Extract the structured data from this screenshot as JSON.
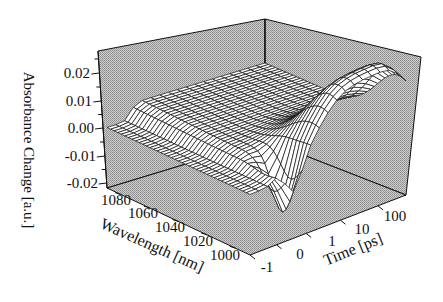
{
  "chart_data": {
    "type": "surface3d",
    "title": "",
    "zlabel": "Absorbance Change [a.u.]",
    "xlabel": "Wavelength [nm]",
    "ylabel": "Time [ps]",
    "z_ticks": [
      "0.02",
      "0.01",
      "0.00",
      "-0.01",
      "-0.02"
    ],
    "z_range": [
      -0.025,
      0.025
    ],
    "wavelength_ticks": [
      "1080",
      "1060",
      "1040",
      "1020",
      "1000"
    ],
    "wavelength_range": [
      1090,
      990
    ],
    "time_ticks": [
      "-1",
      "0",
      "1",
      "10",
      "100"
    ],
    "time_scale": "linear-log",
    "wavelength": [
      1090,
      1080,
      1070,
      1060,
      1050,
      1040,
      1030,
      1020,
      1010,
      1000,
      990
    ],
    "time": [
      -1,
      -0.5,
      0,
      0.5,
      1,
      3,
      10,
      30,
      100,
      300
    ],
    "z_description": "Near-zero before t=0; step rise to ~+0.005 around t=0 at long wavelengths; negative bleach dip reaching ~-0.02 near 1000 nm around 0-1 ps; broad positive band peaking ~+0.02 near 1000 nm at 10-100 ps, decaying at late times",
    "background": "gray dotted pane",
    "grid": false
  },
  "axis_labels": {
    "z": "Absorbance Change [a.u.]",
    "wavelength": "Wavelength [nm]",
    "time": "Time [ps]"
  }
}
